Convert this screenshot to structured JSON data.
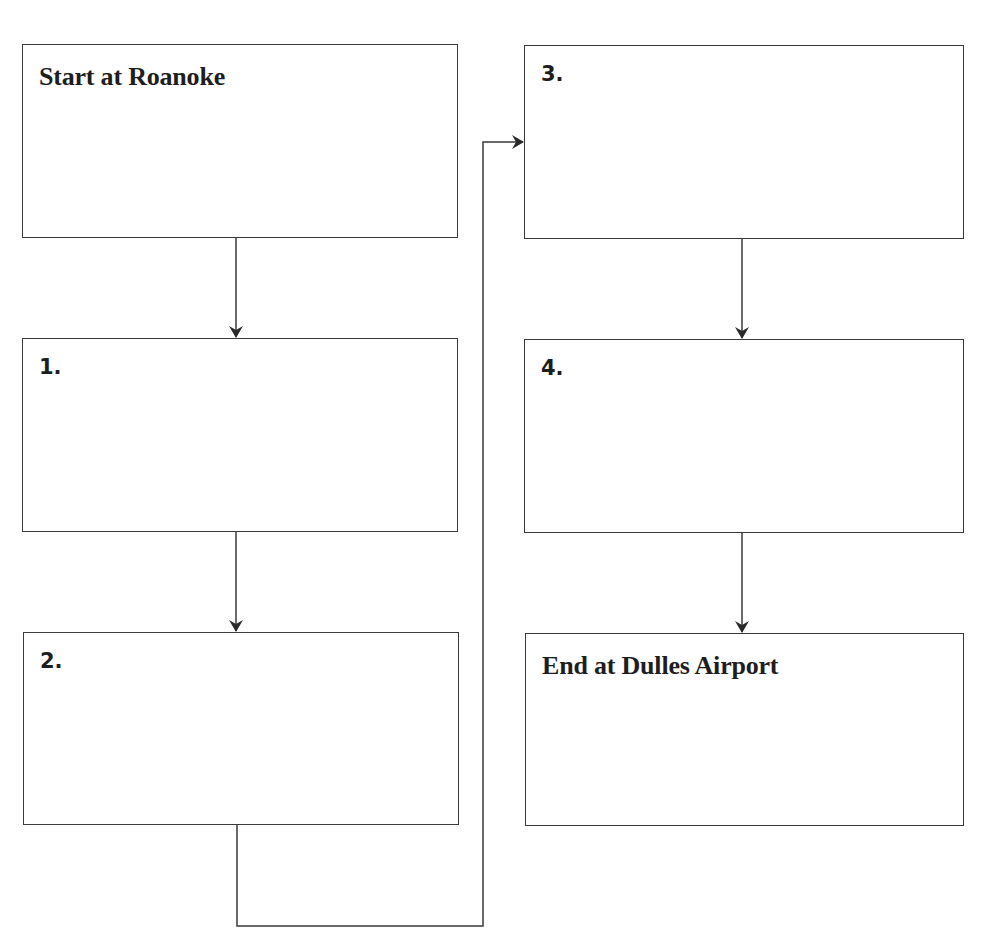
{
  "diagram": {
    "type": "flowchart",
    "title": "",
    "colors": {
      "stroke": "#3a3a3a",
      "text": "#1e1e1e",
      "background": "#ffffff"
    },
    "boxes": [
      {
        "id": "start",
        "label": "Start at Roanoke",
        "style": "serif",
        "column": "left",
        "row": 1
      },
      {
        "id": "step1",
        "label": "1.",
        "style": "sans",
        "column": "left",
        "row": 2
      },
      {
        "id": "step2",
        "label": "2.",
        "style": "sans",
        "column": "left",
        "row": 3
      },
      {
        "id": "step3",
        "label": "3.",
        "style": "sans",
        "column": "right",
        "row": 1
      },
      {
        "id": "step4",
        "label": "4.",
        "style": "sans",
        "column": "right",
        "row": 2
      },
      {
        "id": "end",
        "label": "End at Dulles Airport",
        "style": "serif",
        "column": "right",
        "row": 3
      }
    ],
    "edges": [
      {
        "from": "start",
        "to": "step1"
      },
      {
        "from": "step1",
        "to": "step2"
      },
      {
        "from": "step2",
        "to": "step3",
        "routing": "down-right-up-right"
      },
      {
        "from": "step3",
        "to": "step4"
      },
      {
        "from": "step4",
        "to": "end"
      }
    ]
  }
}
